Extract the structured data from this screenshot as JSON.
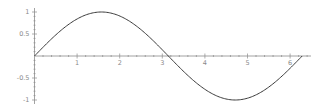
{
  "chart_data": {
    "type": "line",
    "title": "",
    "xlabel": "",
    "ylabel": "",
    "function": "sin(x)",
    "xlim": [
      0,
      6.5
    ],
    "ylim": [
      -1,
      1
    ],
    "x_domain": [
      0,
      6.2832
    ],
    "grid": false,
    "legend": null,
    "x_ticks": [
      1,
      2,
      3,
      4,
      5,
      6
    ],
    "x_tick_labels": [
      "1",
      "2",
      "3",
      "4",
      "5",
      "6"
    ],
    "y_ticks": [
      1,
      0.5,
      -0.5,
      -1
    ],
    "y_tick_labels": [
      "1",
      "0.5",
      "-0.5",
      "-1"
    ],
    "series": [
      {
        "name": "sin(x)",
        "color": "#3a3a3a",
        "x": [
          0,
          0.5236,
          1.0472,
          1.5708,
          2.0944,
          2.618,
          3.1416,
          3.6652,
          4.1888,
          4.7124,
          5.236,
          5.7596,
          6.2832
        ],
        "y": [
          0,
          0.5,
          0.866,
          1,
          0.866,
          0.5,
          0,
          -0.5,
          -0.866,
          -1,
          -0.866,
          -0.5,
          0
        ]
      }
    ]
  },
  "layout": {
    "origin_px": [
      34.5,
      56
    ],
    "x_scale_px_per_unit": 42.6,
    "y_scale_px_per_unit": 44,
    "x_axis_end_px": 311,
    "y_axis_top_px": 8,
    "y_axis_bottom_px": 104
  }
}
